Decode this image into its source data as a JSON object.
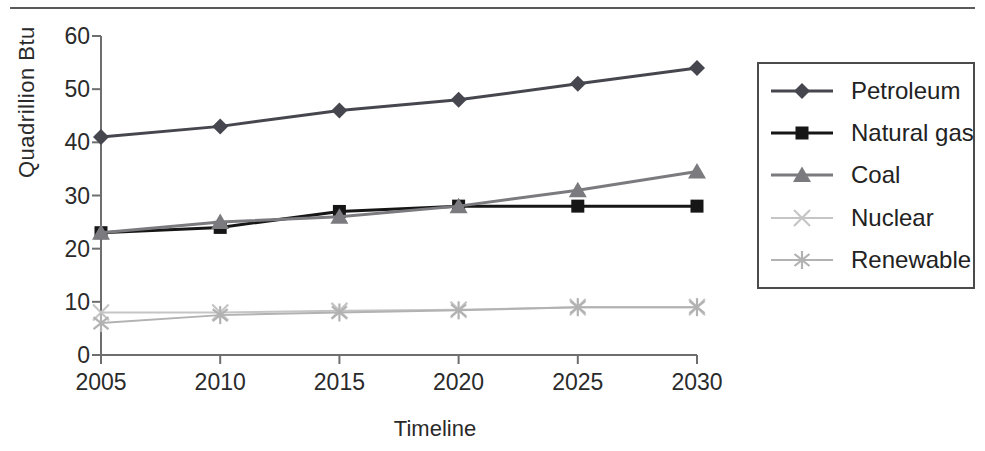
{
  "chart": {
    "y_axis_title": "Quadrillion Btu",
    "x_axis_title": "Timeline",
    "y_ticks": [
      0,
      10,
      20,
      30,
      40,
      50,
      60
    ],
    "x_ticks": [
      "2005",
      "2010",
      "2015",
      "2020",
      "2025",
      "2030"
    ]
  },
  "chart_data": {
    "type": "line",
    "title": "",
    "xlabel": "Timeline",
    "ylabel": "Quadrillion Btu",
    "x": [
      2005,
      2010,
      2015,
      2020,
      2025,
      2030
    ],
    "xlim": [
      2005,
      2030
    ],
    "ylim": [
      0,
      60
    ],
    "grid": false,
    "legend_position": "right-outside",
    "series": [
      {
        "name": "Petroleum",
        "marker": "diamond",
        "color": "#46464e",
        "values": [
          41,
          43,
          46,
          48,
          51,
          54
        ]
      },
      {
        "name": "Natural gas",
        "marker": "square",
        "color": "#161616",
        "values": [
          23,
          24,
          27,
          28,
          28,
          28
        ]
      },
      {
        "name": "Coal",
        "marker": "triangle",
        "color": "#7b7b7f",
        "values": [
          23,
          25,
          26,
          28,
          31,
          34.5
        ]
      },
      {
        "name": "Nuclear",
        "marker": "x",
        "color": "#c5c5c5",
        "values": [
          8,
          8,
          8.3,
          8.5,
          9,
          9
        ]
      },
      {
        "name": "Renewable",
        "marker": "asterisk",
        "color": "#b2b2b2",
        "values": [
          6,
          7.5,
          8,
          8.4,
          9,
          9
        ]
      }
    ],
    "axis_color": "#6e6e6e"
  }
}
